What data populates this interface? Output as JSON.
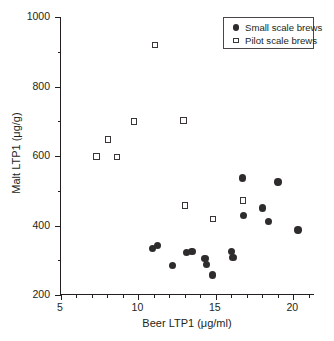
{
  "chart_data": {
    "type": "scatter",
    "title": "",
    "xlabel": "Beer LTP1 (μg/ml)",
    "ylabel": "Malt LTP1 (μg/g)",
    "xlim": [
      5,
      21.4
    ],
    "ylim": [
      200,
      1000
    ],
    "xticks": [
      5,
      10,
      15,
      20
    ],
    "xtick_labels": [
      "5",
      "10",
      "15",
      "20"
    ],
    "xticks_minor": [
      6,
      7,
      8,
      9,
      11,
      12,
      13,
      14,
      16,
      17,
      18,
      19,
      21
    ],
    "yticks": [
      200,
      400,
      600,
      800,
      1000
    ],
    "ytick_labels": [
      "200",
      "400",
      "600",
      "800",
      "1000"
    ],
    "yticks_minor": [
      300,
      500,
      700,
      900
    ],
    "grid": false,
    "legend_position": "top-right",
    "series": [
      {
        "name": "Small scale brews",
        "marker": "filled-circle",
        "color": "#2f2c2d",
        "points": [
          {
            "x": 10.9,
            "y": 333
          },
          {
            "x": 11.25,
            "y": 342
          },
          {
            "x": 12.2,
            "y": 285
          },
          {
            "x": 13.1,
            "y": 322
          },
          {
            "x": 13.45,
            "y": 325
          },
          {
            "x": 14.3,
            "y": 305
          },
          {
            "x": 14.4,
            "y": 287
          },
          {
            "x": 14.8,
            "y": 258
          },
          {
            "x": 16.0,
            "y": 325
          },
          {
            "x": 16.1,
            "y": 308
          },
          {
            "x": 16.7,
            "y": 537
          },
          {
            "x": 16.8,
            "y": 428
          },
          {
            "x": 18.0,
            "y": 450
          },
          {
            "x": 18.4,
            "y": 411
          },
          {
            "x": 19.0,
            "y": 525
          },
          {
            "x": 20.3,
            "y": 387
          }
        ]
      },
      {
        "name": "Pilot scale brews",
        "marker": "open-square",
        "color": "#3a3637",
        "points": [
          {
            "x": 7.3,
            "y": 598
          },
          {
            "x": 8.05,
            "y": 648
          },
          {
            "x": 8.6,
            "y": 597
          },
          {
            "x": 9.7,
            "y": 699
          },
          {
            "x": 11.05,
            "y": 920
          },
          {
            "x": 12.9,
            "y": 702
          },
          {
            "x": 13.0,
            "y": 458
          },
          {
            "x": 14.8,
            "y": 418
          },
          {
            "x": 16.75,
            "y": 472
          }
        ]
      }
    ],
    "legend_entries": [
      {
        "label": "Small scale brews",
        "marker": "filled-circle"
      },
      {
        "label": "Pilot scale brews",
        "marker": "open-square"
      }
    ]
  }
}
